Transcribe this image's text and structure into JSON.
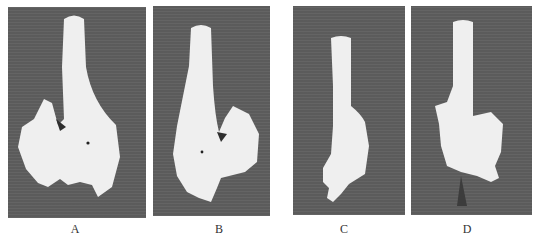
{
  "figure": {
    "panels": [
      {
        "id": "A",
        "label": "A",
        "subject": "bone specimen"
      },
      {
        "id": "B",
        "label": "B",
        "subject": "bone specimen"
      },
      {
        "id": "C",
        "label": "C",
        "subject": "bone specimen"
      },
      {
        "id": "D",
        "label": "D",
        "subject": "bone specimen"
      }
    ],
    "colors": {
      "background": "#5e5e5e",
      "specimen": "#efefef"
    }
  }
}
